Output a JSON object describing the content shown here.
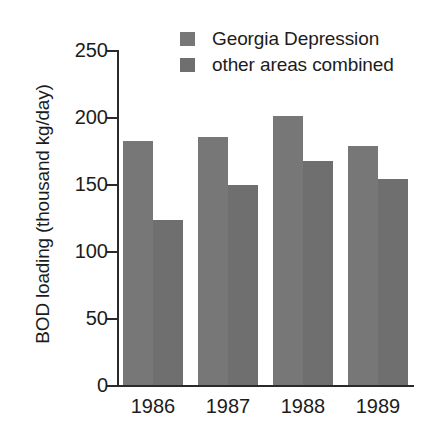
{
  "chart_data": {
    "type": "bar",
    "title": "",
    "xlabel": "",
    "ylabel": "BOD loading (thousand kg/day)",
    "categories": [
      "1986",
      "1987",
      "1988",
      "1989"
    ],
    "ylim": [
      0,
      250
    ],
    "yticks": [
      0,
      50,
      100,
      150,
      200,
      250
    ],
    "ytick_labels": [
      "0",
      "50",
      "100",
      "150",
      "200",
      "250"
    ],
    "grid": false,
    "legend_position": "top-center",
    "series": [
      {
        "name": "Georgia Depression",
        "color": "#777777",
        "values": [
          182,
          185,
          201,
          178
        ]
      },
      {
        "name": "other areas combined",
        "color": "#6f6f6f",
        "values": [
          123,
          149,
          167,
          154
        ]
      }
    ]
  },
  "legend": {
    "items": [
      {
        "label": "Georgia Depression",
        "swatch_icon": "legend-swatch-icon"
      },
      {
        "label": "other areas combined",
        "swatch_icon": "legend-swatch-icon"
      }
    ]
  },
  "axis": {
    "y_title": "BOD loading (thousand kg/day)"
  },
  "colors": {
    "bar_series_1": "#787878",
    "bar_series_2": "#6e6e6e",
    "axis": "#2a2a2a",
    "text": "#1c1c1c",
    "background": "#ffffff"
  }
}
